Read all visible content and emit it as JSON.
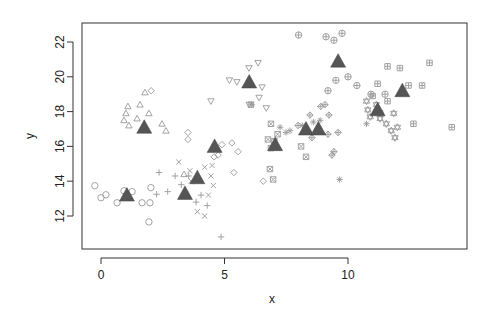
{
  "chart_data": {
    "type": "scatter",
    "title": "",
    "xlabel": "x",
    "ylabel": "y",
    "xlim": [
      -0.8,
      14.8
    ],
    "ylim": [
      10.2,
      23.1
    ],
    "xticks": [
      0,
      5,
      10
    ],
    "yticks": [
      12,
      14,
      16,
      18,
      20,
      22
    ],
    "grid": false,
    "legend": "none",
    "point_color": "#999999",
    "center_color": "#555555",
    "groups": [
      {
        "pch": "circle",
        "center": [
          1.05,
          13.2
        ],
        "points": [
          [
            -0.25,
            13.74
          ],
          [
            0,
            13.05
          ],
          [
            0.2,
            13.22
          ],
          [
            0.65,
            12.76
          ],
          [
            0.93,
            13.45
          ],
          [
            1.26,
            13.4
          ],
          [
            1.66,
            12.76
          ],
          [
            1.98,
            12.76
          ],
          [
            1.94,
            11.66
          ],
          [
            2.02,
            13.63
          ]
        ]
      },
      {
        "pch": "triangle",
        "center": [
          1.75,
          17.1
        ],
        "points": [
          [
            1.78,
            19.1
          ],
          [
            1.09,
            18.3
          ],
          [
            1.58,
            18.4
          ],
          [
            1.01,
            17.9
          ],
          [
            0.93,
            17.5
          ],
          [
            1.46,
            17.6
          ],
          [
            1.94,
            17.9
          ],
          [
            2.47,
            17.3
          ],
          [
            2.63,
            16.9
          ],
          [
            1.13,
            17.2
          ],
          [
            3.36,
            14.4
          ]
        ]
      },
      {
        "pch": "plus",
        "center": [
          3.4,
          13.3
        ],
        "points": [
          [
            2.35,
            14.5
          ],
          [
            2.7,
            13.4
          ],
          [
            3.0,
            14.3
          ],
          [
            3.25,
            13.8
          ],
          [
            3.55,
            14.3
          ],
          [
            3.85,
            12.8
          ],
          [
            4.3,
            12.6
          ],
          [
            4.05,
            13.2
          ],
          [
            3.75,
            14.0
          ],
          [
            4.86,
            10.8
          ],
          [
            2.25,
            13.25
          ]
        ]
      },
      {
        "pch": "cross",
        "center": [
          3.9,
          14.2
        ],
        "points": [
          [
            3.15,
            15.1
          ],
          [
            3.6,
            14.6
          ],
          [
            4.2,
            14.8
          ],
          [
            4.45,
            14.3
          ],
          [
            4.55,
            13.75
          ],
          [
            4.35,
            13.2
          ],
          [
            3.9,
            12.25
          ],
          [
            4.2,
            12.0
          ],
          [
            3.65,
            14.0
          ],
          [
            4.5,
            14.9
          ]
        ]
      },
      {
        "pch": "diamond",
        "center": [
          4.6,
          16.0
        ],
        "points": [
          [
            2.03,
            19.2
          ],
          [
            3.52,
            16.8
          ],
          [
            3.52,
            16.4
          ],
          [
            4.9,
            16.1
          ],
          [
            4.74,
            15.5
          ],
          [
            4.58,
            15.4
          ],
          [
            5.55,
            15.7
          ],
          [
            5.38,
            14.5
          ],
          [
            6.57,
            14.0
          ],
          [
            5.3,
            16.2
          ]
        ]
      },
      {
        "pch": "triangle-down",
        "center": [
          6.0,
          19.7
        ],
        "points": [
          [
            6.36,
            20.8
          ],
          [
            5.99,
            20.5
          ],
          [
            5.5,
            19.7
          ],
          [
            6.52,
            19.4
          ],
          [
            6.4,
            18.8
          ],
          [
            6.69,
            18.2
          ],
          [
            4.45,
            18.6
          ],
          [
            6.0,
            18.4
          ],
          [
            5.2,
            19.8
          ]
        ]
      },
      {
        "pch": "square-cross",
        "center": [
          7.05,
          16.1
        ],
        "points": [
          [
            6.07,
            18.4
          ],
          [
            6.88,
            17.3
          ],
          [
            6.76,
            16.4
          ],
          [
            6.88,
            15.9
          ],
          [
            8.1,
            16.0
          ],
          [
            8.3,
            15.4
          ],
          [
            6.84,
            14.7
          ],
          [
            6.97,
            14.1
          ],
          [
            7.15,
            16.7
          ],
          [
            7.02,
            16.3
          ]
        ]
      },
      {
        "pch": "asterisk",
        "center": [
          8.3,
          17.0
        ],
        "points": [
          [
            7.65,
            16.9
          ],
          [
            7.49,
            16.8
          ],
          [
            9.66,
            14.1
          ],
          [
            10.75,
            17.3
          ],
          [
            8.87,
            17.5
          ],
          [
            7.25,
            17.1
          ],
          [
            8.6,
            17.4
          ],
          [
            8.15,
            17.2
          ],
          [
            6.1,
            18.4
          ]
        ]
      },
      {
        "pch": "diamond-plus",
        "center": [
          8.8,
          17.0
        ],
        "points": [
          [
            8.46,
            17.8
          ],
          [
            9.07,
            18.4
          ],
          [
            9.23,
            17.8
          ],
          [
            8.54,
            16.5
          ],
          [
            9.19,
            16.7
          ],
          [
            9.43,
            15.7
          ],
          [
            9.35,
            15.5
          ],
          [
            7.98,
            17.2
          ],
          [
            9.6,
            16.8
          ],
          [
            8.9,
            18.3
          ]
        ]
      },
      {
        "pch": "circle-plus",
        "center": [
          9.6,
          20.9
        ],
        "points": [
          [
            9.76,
            22.5
          ],
          [
            9.43,
            22.1
          ],
          [
            9.11,
            22.3
          ],
          [
            9.51,
            19.8
          ],
          [
            10.0,
            20.0
          ],
          [
            10.36,
            19.5
          ],
          [
            9.19,
            19.2
          ],
          [
            10.93,
            19.0
          ],
          [
            11.5,
            19.0
          ],
          [
            8.0,
            22.4
          ]
        ]
      },
      {
        "pch": "square-plus",
        "center": [
          12.2,
          19.2
        ],
        "points": [
          [
            11.6,
            20.6
          ],
          [
            12.1,
            20.5
          ],
          [
            13.3,
            20.8
          ],
          [
            12.45,
            19.5
          ],
          [
            14.2,
            17.1
          ],
          [
            11.2,
            19.6
          ],
          [
            11.6,
            18.6
          ],
          [
            11.0,
            18.9
          ],
          [
            11.3,
            17.9
          ],
          [
            12.65,
            17.3
          ],
          [
            13.0,
            19.5
          ]
        ]
      },
      {
        "pch": "star-of-david",
        "center": [
          11.2,
          18.1
        ],
        "points": [
          [
            10.75,
            18.6
          ],
          [
            10.8,
            18.1
          ],
          [
            11.3,
            17.6
          ],
          [
            11.55,
            17.3
          ],
          [
            11.85,
            17.9
          ],
          [
            12.0,
            17.1
          ],
          [
            11.75,
            16.9
          ],
          [
            11.9,
            16.5
          ],
          [
            10.9,
            17.7
          ],
          [
            11.15,
            18.4
          ]
        ]
      }
    ]
  }
}
